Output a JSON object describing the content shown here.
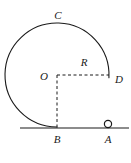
{
  "figure": {
    "kind": "geometry-diagram",
    "background_color": "#ffffff",
    "stroke_color": "#1a1a1a",
    "label_color": "#1a1a1a",
    "canvas": {
      "width": 131,
      "height": 163
    },
    "circle": {
      "center": {
        "x": 57,
        "y": 75
      },
      "radius": 52,
      "arc_start_deg": 90,
      "arc_end_deg": 3,
      "stroke_width": 1.1,
      "style": "solid"
    },
    "ground_line": {
      "x1": 20,
      "y1": 128,
      "x2": 129,
      "y2": 128,
      "stroke_width": 1.2,
      "style": "solid"
    },
    "radius_dashed": {
      "from": {
        "x": 57,
        "y": 75
      },
      "to": {
        "x": 109,
        "y": 75
      },
      "style": "dashed",
      "dash_pattern": "3,2.5",
      "stroke_width": 1
    },
    "vertical_dashed": {
      "from": {
        "x": 57,
        "y": 75
      },
      "to": {
        "x": 57,
        "y": 128
      },
      "style": "dashed",
      "dash_pattern": "3,2.5",
      "stroke_width": 1
    },
    "point_marker_a": {
      "center": {
        "x": 108,
        "y": 124
      },
      "radius": 3.6,
      "fill": "#ffffff",
      "stroke_width": 1.2
    },
    "labels": [
      {
        "id": "label-c",
        "text": "C",
        "x": 58,
        "y": 15,
        "font_size": 11
      },
      {
        "id": "label-r",
        "text": "R",
        "x": 84,
        "y": 62,
        "font_size": 11
      },
      {
        "id": "label-o",
        "text": "O",
        "x": 44,
        "y": 76,
        "font_size": 11
      },
      {
        "id": "label-d",
        "text": "D",
        "x": 119,
        "y": 79,
        "font_size": 11
      },
      {
        "id": "label-b",
        "text": "B",
        "x": 57,
        "y": 139,
        "font_size": 11
      },
      {
        "id": "label-a",
        "text": "A",
        "x": 108,
        "y": 139,
        "font_size": 11
      }
    ]
  }
}
